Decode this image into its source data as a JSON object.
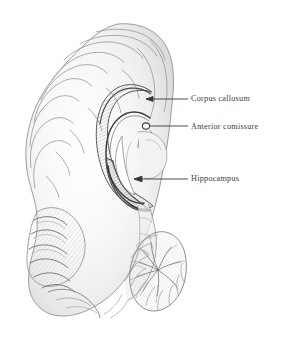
{
  "figure": {
    "kind": "anatomical-illustration",
    "medium": "graphite pencil drawing",
    "background_color": "#ffffff",
    "ink_color": "#3c3a38",
    "sketch_color": "#8c8a88"
  },
  "labels": [
    {
      "id": "corpus-callosum",
      "text": "Corpus callosum",
      "leader": {
        "x1": 148,
        "y1": 99,
        "x2": 188,
        "y2": 99,
        "marker": "arrow-left"
      }
    },
    {
      "id": "anterior-comissure",
      "text": "Anterior comissure",
      "leader": {
        "x1": 148,
        "y1": 126,
        "x2": 188,
        "y2": 126,
        "marker": "circle-left"
      }
    },
    {
      "id": "hippocampus",
      "text": "Hippocampus",
      "leader": {
        "x1": 136,
        "y1": 179,
        "x2": 188,
        "y2": 179,
        "marker": "arrow-left"
      }
    }
  ],
  "structures": [
    {
      "id": "cerebral-cortex",
      "name": "cerebral cortex with gyri and sulci"
    },
    {
      "id": "corpus-callosum-body",
      "name": "corpus callosum"
    },
    {
      "id": "fornix",
      "name": "fornix"
    },
    {
      "id": "lateral-ventricle",
      "name": "lateral ventricle"
    },
    {
      "id": "hippocampal-curve",
      "name": "hippocampus"
    },
    {
      "id": "anterior-comissure-node",
      "name": "anterior comissure"
    },
    {
      "id": "brainstem",
      "name": "brainstem"
    },
    {
      "id": "cerebellum",
      "name": "cerebellum with arbor vitae"
    }
  ]
}
